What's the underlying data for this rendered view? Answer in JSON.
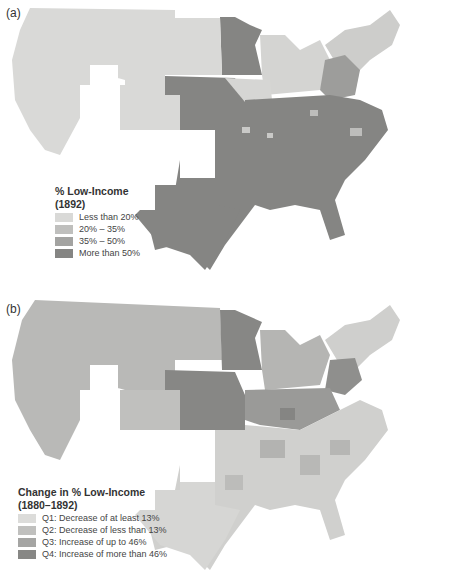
{
  "panel_a": {
    "label": "(a)",
    "legend": {
      "title_line1": "% Low-Income",
      "title_line2": "(1892)",
      "items": [
        {
          "label": "Less than 20%",
          "color": "#d9d9d7"
        },
        {
          "label": "20% – 35%",
          "color": "#bfbfbd"
        },
        {
          "label": "35% – 50%",
          "color": "#a3a3a1"
        },
        {
          "label": "More than 50%",
          "color": "#858583"
        }
      ]
    }
  },
  "panel_b": {
    "label": "(b)",
    "legend": {
      "title_line1": "Change in % Low-Income",
      "title_line2": "(1880–1892)",
      "items": [
        {
          "label": "Q1: Decrease of at least 13%",
          "color": "#dcdcda"
        },
        {
          "label": "Q2: Decrease of less than 13%",
          "color": "#c0c0be"
        },
        {
          "label": "Q3: Increase of up to 46%",
          "color": "#a5a5a3"
        },
        {
          "label": "Q4: Increase of more than 46%",
          "color": "#878785"
        }
      ]
    }
  }
}
